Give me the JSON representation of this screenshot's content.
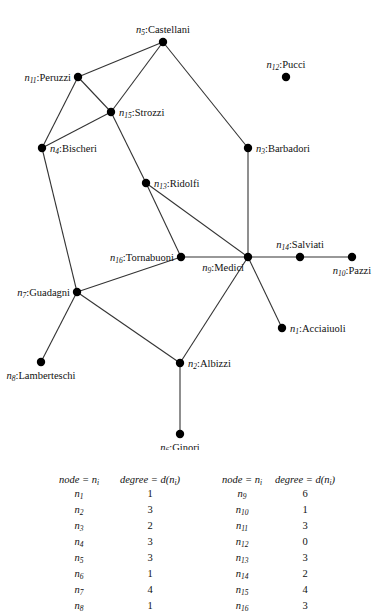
{
  "graph": {
    "nodes": [
      {
        "id": "n1",
        "num": "1",
        "name": "Acciaiuoli",
        "x": 282,
        "y": 328,
        "label_pos": "right"
      },
      {
        "id": "n2",
        "num": "2",
        "name": "Albizzi",
        "x": 180,
        "y": 363,
        "label_pos": "right"
      },
      {
        "id": "n3",
        "num": "3",
        "name": "Barbadori",
        "x": 248,
        "y": 148,
        "label_pos": "right"
      },
      {
        "id": "n4",
        "num": "4",
        "name": "Bischeri",
        "x": 42,
        "y": 148,
        "label_pos": "right"
      },
      {
        "id": "n5",
        "num": "5",
        "name": "Castellani",
        "x": 163,
        "y": 42,
        "label_pos": "top"
      },
      {
        "id": "n6",
        "num": "6",
        "name": "Ginori",
        "x": 180,
        "y": 434,
        "label_pos": "bottom"
      },
      {
        "id": "n7",
        "num": "7",
        "name": "Guadagni",
        "x": 77,
        "y": 292,
        "label_pos": "left"
      },
      {
        "id": "n8",
        "num": "8",
        "name": "Lamberteschi",
        "x": 41,
        "y": 362,
        "label_pos": "bottom"
      },
      {
        "id": "n9",
        "num": "9",
        "name": "Medici",
        "x": 248,
        "y": 257,
        "label_pos": "bottom-left"
      },
      {
        "id": "n10",
        "num": "10",
        "name": "Pazzi",
        "x": 352,
        "y": 257,
        "label_pos": "bottom"
      },
      {
        "id": "n11",
        "num": "11",
        "name": "Peruzzi",
        "x": 78,
        "y": 77,
        "label_pos": "left"
      },
      {
        "id": "n12",
        "num": "12",
        "name": "Pucci",
        "x": 286,
        "y": 77,
        "label_pos": "top"
      },
      {
        "id": "n13",
        "num": "13",
        "name": "Ridolfi",
        "x": 146,
        "y": 183,
        "label_pos": "right"
      },
      {
        "id": "n14",
        "num": "14",
        "name": "Salviati",
        "x": 300,
        "y": 257,
        "label_pos": "top"
      },
      {
        "id": "n15",
        "num": "15",
        "name": "Strozzi",
        "x": 111,
        "y": 112,
        "label_pos": "right"
      },
      {
        "id": "n16",
        "num": "16",
        "name": "Tornabuoni",
        "x": 181,
        "y": 257,
        "label_pos": "left"
      }
    ],
    "edges": [
      [
        "n5",
        "n11"
      ],
      [
        "n5",
        "n15"
      ],
      [
        "n5",
        "n3"
      ],
      [
        "n11",
        "n15"
      ],
      [
        "n11",
        "n4"
      ],
      [
        "n15",
        "n4"
      ],
      [
        "n15",
        "n13"
      ],
      [
        "n4",
        "n7"
      ],
      [
        "n3",
        "n9"
      ],
      [
        "n13",
        "n9"
      ],
      [
        "n13",
        "n16"
      ],
      [
        "n16",
        "n9"
      ],
      [
        "n16",
        "n7"
      ],
      [
        "n9",
        "n14"
      ],
      [
        "n14",
        "n10"
      ],
      [
        "n9",
        "n1"
      ],
      [
        "n9",
        "n2"
      ],
      [
        "n7",
        "n2"
      ],
      [
        "n7",
        "n8"
      ],
      [
        "n2",
        "n6"
      ]
    ]
  },
  "table": {
    "headers": {
      "node": "node = n",
      "node_sub": "i",
      "degree": "degree = d(n",
      "degree_sub": "i",
      "degree_close": ")"
    },
    "left": [
      {
        "node": "1",
        "degree": "1"
      },
      {
        "node": "2",
        "degree": "3"
      },
      {
        "node": "3",
        "degree": "2"
      },
      {
        "node": "4",
        "degree": "3"
      },
      {
        "node": "5",
        "degree": "3"
      },
      {
        "node": "6",
        "degree": "1"
      },
      {
        "node": "7",
        "degree": "4"
      },
      {
        "node": "8",
        "degree": "1"
      }
    ],
    "right": [
      {
        "node": "9",
        "degree": "6"
      },
      {
        "node": "10",
        "degree": "1"
      },
      {
        "node": "11",
        "degree": "3"
      },
      {
        "node": "12",
        "degree": "0"
      },
      {
        "node": "13",
        "degree": "3"
      },
      {
        "node": "14",
        "degree": "2"
      },
      {
        "node": "15",
        "degree": "4"
      },
      {
        "node": "16",
        "degree": "3"
      }
    ]
  }
}
